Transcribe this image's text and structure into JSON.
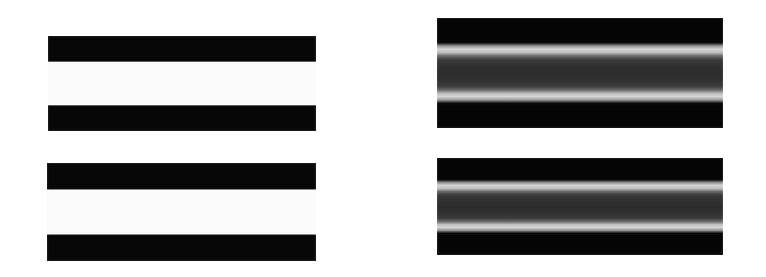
{
  "figure": {
    "background_color": "#ffffff",
    "width": 766,
    "height": 277,
    "panel_count": 4
  },
  "panels": [
    {
      "id": "panel-top-left",
      "profile_type": "square-wave-step",
      "position": {
        "x": 48,
        "y": 36,
        "width": 268,
        "height": 95
      },
      "bands": [
        {
          "name": "upper-dark-band",
          "color": "#050505",
          "extent_pct": [
            0,
            27
          ]
        },
        {
          "name": "center-light-band",
          "color": "#fdfdfd",
          "extent_pct": [
            27,
            73
          ]
        },
        {
          "name": "lower-dark-band",
          "color": "#050505",
          "extent_pct": [
            73,
            100
          ]
        }
      ]
    },
    {
      "id": "panel-top-right",
      "profile_type": "cornsweet-gradient",
      "position": {
        "x": 437,
        "y": 18,
        "width": 286,
        "height": 110
      },
      "bands": [
        {
          "name": "upper-dark-band",
          "color": "#030303",
          "extent_pct": [
            0,
            22
          ]
        },
        {
          "name": "upper-bright-stripe",
          "color": "#d6d6d6",
          "extent_pct": [
            25,
            31
          ]
        },
        {
          "name": "center-gray-band",
          "color": "#2b2b2b",
          "extent_pct": [
            38,
            62
          ]
        },
        {
          "name": "lower-bright-stripe",
          "color": "#d8d8d8",
          "extent_pct": [
            68,
            75
          ]
        },
        {
          "name": "lower-dark-band",
          "color": "#030303",
          "extent_pct": [
            79,
            100
          ]
        }
      ]
    },
    {
      "id": "panel-bottom-left",
      "profile_type": "square-wave-step",
      "position": {
        "x": 47,
        "y": 163,
        "width": 269,
        "height": 98
      },
      "bands": [
        {
          "name": "upper-dark-band",
          "color": "#050505",
          "extent_pct": [
            0,
            27
          ]
        },
        {
          "name": "center-light-band",
          "color": "#fdfdfd",
          "extent_pct": [
            27,
            73
          ]
        },
        {
          "name": "lower-dark-band",
          "color": "#050505",
          "extent_pct": [
            73,
            100
          ]
        }
      ]
    },
    {
      "id": "panel-bottom-right",
      "profile_type": "cornsweet-gradient",
      "position": {
        "x": 437,
        "y": 158,
        "width": 286,
        "height": 97
      },
      "bands": [
        {
          "name": "upper-dark-band",
          "color": "#030303",
          "extent_pct": [
            0,
            22
          ]
        },
        {
          "name": "upper-bright-stripe",
          "color": "#d6d6d6",
          "extent_pct": [
            25,
            31
          ]
        },
        {
          "name": "center-gray-band",
          "color": "#2b2b2b",
          "extent_pct": [
            38,
            62
          ]
        },
        {
          "name": "lower-bright-stripe",
          "color": "#d8d8d8",
          "extent_pct": [
            68,
            75
          ]
        },
        {
          "name": "lower-dark-band",
          "color": "#030303",
          "extent_pct": [
            79,
            100
          ]
        }
      ]
    }
  ]
}
